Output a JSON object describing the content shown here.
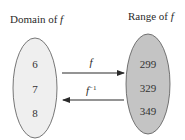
{
  "domain": {
    "title": "Domain of ",
    "title_var": "f",
    "values": [
      "6",
      "7",
      "8"
    ],
    "fill": "#efefef"
  },
  "range": {
    "title": "Range of ",
    "title_var": "f",
    "values": [
      "299",
      "329",
      "349"
    ],
    "fill": "#c4c4c4"
  },
  "arrows": {
    "forward_label": "f",
    "inverse_label": "f",
    "inverse_sup": "−1"
  }
}
